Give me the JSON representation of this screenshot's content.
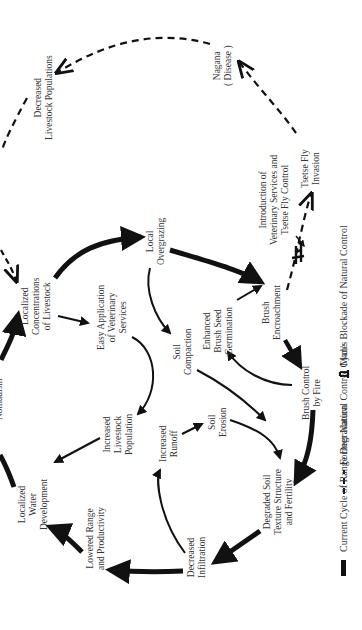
{
  "diagram": {
    "orientation": "rotated -90deg",
    "nodes": {
      "decreased_livestock": [
        "Decreased",
        "Livestock Populations"
      ],
      "nagana": [
        "Nagana",
        "( Disease )"
      ],
      "tsetse_fly_invasion": [
        "Tsetse Fly",
        "Invasion"
      ],
      "localized_concentrations": [
        "Localized",
        "Concentrations",
        "of Livestock"
      ],
      "easy_application": [
        "Easy Application",
        "of Veterinary",
        "Services"
      ],
      "local_overgrazing": [
        "Local",
        "Overgrazing"
      ],
      "introduction_vet": [
        "Introduction of",
        "Veterinary Services and",
        "Tsetse Fly Control"
      ],
      "soil_compaction": [
        "Soil",
        "Compaction"
      ],
      "enhanced_brush": [
        "Enhanced",
        "Brush Seed",
        "Germination"
      ],
      "brush_encroachment": [
        "Brush",
        "Encroachment"
      ],
      "nomadism": [
        "Nomadism"
      ],
      "increased_livestock": [
        "Increased",
        "Livestock",
        "Population"
      ],
      "increased_runoff": [
        "Increased",
        "Runoff"
      ],
      "soil_erosion": [
        "Soil",
        "Erosion"
      ],
      "brush_control": [
        "Brush Control",
        "by Fire"
      ],
      "localized_water": [
        "Localized",
        "Water",
        "Development"
      ],
      "lowered_range": [
        "Lowered Range",
        "and Productivity"
      ],
      "decreased_infiltration": [
        "Decreased",
        "Infiltration"
      ],
      "degraded_soil": [
        "Degraded Soil",
        "Texture Structure",
        "and Fertility"
      ]
    },
    "legend": {
      "current": "Current Cycle of Range Degradation",
      "former": "Former Natural Control Cycle",
      "blockade": "Man's Blockade of Natural Control"
    }
  }
}
